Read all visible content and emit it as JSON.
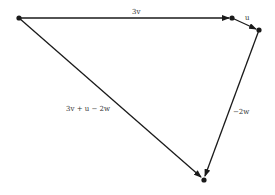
{
  "diagram": {
    "color": "#1a1a1a",
    "label_color": "#333333",
    "points": [
      {
        "id": "start",
        "name": "origin-point"
      },
      {
        "id": "after_3v",
        "name": "point-after-3v"
      },
      {
        "id": "after_u",
        "name": "point-after-u"
      },
      {
        "id": "end",
        "name": "end-point"
      }
    ],
    "vectors": [
      {
        "id": "v3",
        "from": "start",
        "to": "after_3v",
        "label": "3v"
      },
      {
        "id": "u",
        "from": "after_3v",
        "to": "after_u",
        "label": "u"
      },
      {
        "id": "w2",
        "from": "after_u",
        "to": "end",
        "label": "−2w"
      },
      {
        "id": "resultant",
        "from": "start",
        "to": "end",
        "label": "3v + u − 2w"
      }
    ]
  }
}
